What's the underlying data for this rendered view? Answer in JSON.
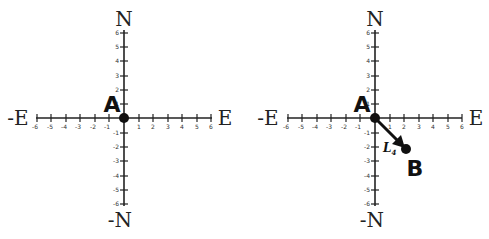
{
  "figure": {
    "panels": [
      {
        "id": "left",
        "axis_labels": {
          "top": "N",
          "bottom": "-N",
          "left": "-E",
          "right": "E"
        },
        "x_ticks": [
          "-6",
          "-5",
          "-4",
          "-3",
          "-2",
          "-1",
          "1",
          "2",
          "3",
          "4",
          "5",
          "6"
        ],
        "y_ticks": [
          "6",
          "5",
          "4",
          "3",
          "2",
          "1",
          "-1",
          "-2",
          "-3",
          "-4",
          "-5",
          "-6"
        ],
        "points": [
          {
            "label": "A",
            "x": 0,
            "y": 0
          }
        ]
      },
      {
        "id": "right",
        "axis_labels": {
          "top": "N",
          "bottom": "-N",
          "left": "-E",
          "right": "E"
        },
        "x_ticks": [
          "-6",
          "-5",
          "-4",
          "-3",
          "-2",
          "-1",
          "1",
          "2",
          "3",
          "4",
          "5",
          "6"
        ],
        "y_ticks": [
          "6",
          "5",
          "4",
          "3",
          "2",
          "1",
          "-1",
          "-2",
          "-3",
          "-4",
          "-5",
          "-6"
        ],
        "points": [
          {
            "label": "A",
            "x": 0,
            "y": 0
          },
          {
            "label": "B",
            "x": 2,
            "y": -2
          }
        ],
        "vector": {
          "from": "A",
          "to": "B",
          "label": "L",
          "subscript": "4"
        }
      }
    ],
    "colors": {
      "ink": "#222222",
      "background": "#ffffff"
    }
  }
}
